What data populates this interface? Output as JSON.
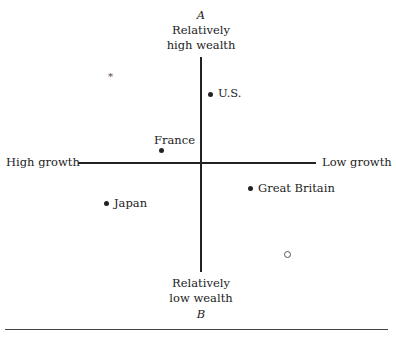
{
  "diagram": {
    "top_pole": {
      "letter": "A",
      "line1": "Relatively",
      "line2": "high wealth"
    },
    "bottom_pole": {
      "letter": "B",
      "line1": "Relatively",
      "line2": "low wealth"
    },
    "left_label": "High growth",
    "right_label": "Low growth",
    "points": [
      {
        "label": "U.S.",
        "x": 210,
        "y": 94
      },
      {
        "label": "France",
        "x": 161,
        "y": 150
      },
      {
        "label": "Japan",
        "x": 106,
        "y": 203
      },
      {
        "label": "Great Britain",
        "x": 250,
        "y": 188
      }
    ],
    "markers": {
      "asterisk": "*",
      "open_circle": "○"
    }
  }
}
